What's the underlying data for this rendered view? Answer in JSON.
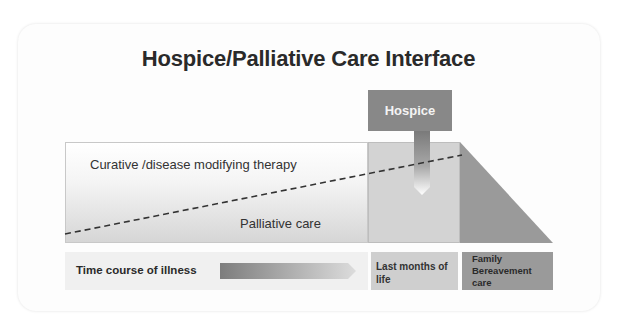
{
  "title": "Hospice/Palliative Care Interface",
  "hospice": {
    "label": "Hospice"
  },
  "zones": {
    "curative_label": "Curative /disease modifying therapy",
    "palliative_label": "Palliative care"
  },
  "timeline": {
    "time_label": "Time course of illness",
    "last_months_label": "Last months of life",
    "family_label": "Family Bereavement care"
  },
  "colors": {
    "hospice_box": "#888888",
    "last_months": "#d3d3d3",
    "bereavement": "#9a9a9a",
    "title": "#2a2a2a"
  }
}
